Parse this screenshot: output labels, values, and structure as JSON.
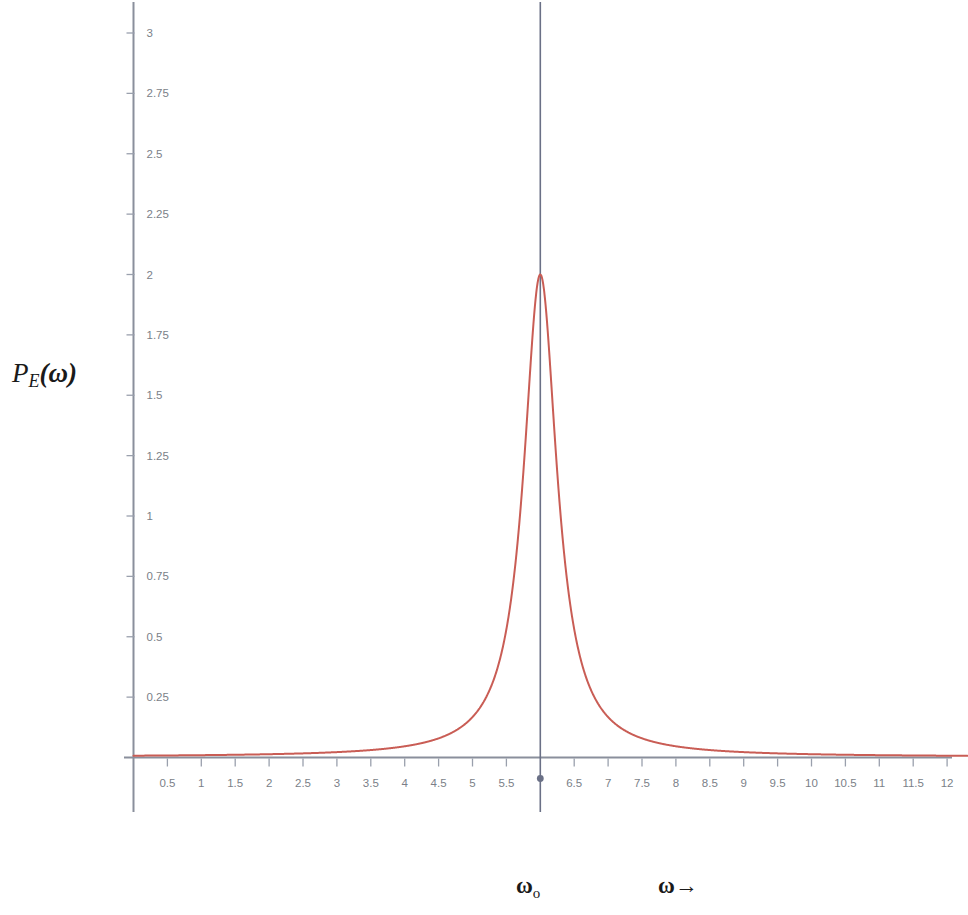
{
  "figure": {
    "type": "line-plot",
    "background_color": "#ffffff",
    "curve_color": "#c95d55",
    "axis_color": "#8a8f9c",
    "marker_line_color": "#6a7086",
    "tick_label_color": "#7b7f88"
  },
  "labels": {
    "y_axis_label_main": "P",
    "y_axis_label_sub": "E",
    "y_axis_label_arg": "(ω)",
    "omega_zero_main": "ω",
    "omega_zero_sub": "o",
    "omega_axis_arrow": "ω→"
  },
  "chart_data": {
    "type": "line",
    "title": "",
    "xlabel": "ω→",
    "ylabel": "P_E(ω)",
    "xlim": [
      0,
      12.3
    ],
    "ylim": [
      0,
      3.15
    ],
    "grid": false,
    "legend": "none",
    "annotations": [
      {
        "text": "ωₒ",
        "x": 6,
        "description": "resonance-frequency-marker-vertical-line"
      }
    ],
    "x_ticks": [
      0.5,
      1,
      1.5,
      2,
      2.5,
      3,
      3.5,
      4,
      4.5,
      5,
      5.5,
      6,
      6.5,
      7,
      7.5,
      8,
      8.5,
      9,
      9.5,
      10,
      10.5,
      11,
      11.5,
      12
    ],
    "x_tick_labels": [
      "0.5",
      "1",
      "1.5",
      "2",
      "2.5",
      "3",
      "3.5",
      "4",
      "4.5",
      "5",
      "5.5",
      "",
      "6.5",
      "7",
      "7.5",
      "8",
      "8.5",
      "9",
      "9.5",
      "10",
      "10.5",
      "11",
      "11.5",
      "12"
    ],
    "y_ticks": [
      0.25,
      0.5,
      0.75,
      1,
      1.25,
      1.5,
      1.75,
      2,
      2.25,
      2.5,
      2.75,
      3
    ],
    "y_tick_labels": [
      "0.25",
      "0.5",
      "0.75",
      "1",
      "1.25",
      "1.5",
      "1.75",
      "2",
      "2.25",
      "2.5",
      "2.75",
      "3"
    ],
    "series": [
      {
        "name": "P_E(ω)",
        "color": "#c95d55",
        "shape": "lorentzian",
        "peak_x": 6.0,
        "peak_y": 2.0,
        "half_width_half_max": 0.3,
        "points": [
          {
            "x": 0.0,
            "y": 0.0025
          },
          {
            "x": 0.5,
            "y": 0.0029
          },
          {
            "x": 1.0,
            "y": 0.0036
          },
          {
            "x": 1.5,
            "y": 0.0044
          },
          {
            "x": 2.0,
            "y": 0.0056
          },
          {
            "x": 2.5,
            "y": 0.0073
          },
          {
            "x": 3.0,
            "y": 0.0099
          },
          {
            "x": 3.5,
            "y": 0.0142
          },
          {
            "x": 4.0,
            "y": 0.0221
          },
          {
            "x": 4.25,
            "y": 0.0289
          },
          {
            "x": 4.5,
            "y": 0.0392
          },
          {
            "x": 4.75,
            "y": 0.0559
          },
          {
            "x": 5.0,
            "y": 0.0847
          },
          {
            "x": 5.25,
            "y": 0.1385
          },
          {
            "x": 5.4,
            "y": 0.1975
          },
          {
            "x": 5.5,
            "y": 0.2571
          },
          {
            "x": 5.6,
            "y": 0.36
          },
          {
            "x": 5.7,
            "y": 0.5294
          },
          {
            "x": 5.75,
            "y": 0.64
          },
          {
            "x": 5.8,
            "y": 0.8
          },
          {
            "x": 5.85,
            "y": 1.0
          },
          {
            "x": 5.9,
            "y": 1.2414
          },
          {
            "x": 5.95,
            "y": 1.5789
          },
          {
            "x": 6.0,
            "y": 2.0
          },
          {
            "x": 6.05,
            "y": 1.5789
          },
          {
            "x": 6.1,
            "y": 1.2414
          },
          {
            "x": 6.15,
            "y": 1.0
          },
          {
            "x": 6.2,
            "y": 0.8
          },
          {
            "x": 6.25,
            "y": 0.64
          },
          {
            "x": 6.3,
            "y": 0.5294
          },
          {
            "x": 6.4,
            "y": 0.36
          },
          {
            "x": 6.5,
            "y": 0.2571
          },
          {
            "x": 6.6,
            "y": 0.1975
          },
          {
            "x": 6.75,
            "y": 0.1385
          },
          {
            "x": 7.0,
            "y": 0.0847
          },
          {
            "x": 7.25,
            "y": 0.0559
          },
          {
            "x": 7.5,
            "y": 0.0392
          },
          {
            "x": 7.75,
            "y": 0.0289
          },
          {
            "x": 8.0,
            "y": 0.0221
          },
          {
            "x": 8.5,
            "y": 0.0142
          },
          {
            "x": 9.0,
            "y": 0.0099
          },
          {
            "x": 9.5,
            "y": 0.0073
          },
          {
            "x": 10.0,
            "y": 0.0056
          },
          {
            "x": 10.5,
            "y": 0.0044
          },
          {
            "x": 11.0,
            "y": 0.0036
          },
          {
            "x": 11.5,
            "y": 0.0029
          },
          {
            "x": 12.0,
            "y": 0.0025
          },
          {
            "x": 12.3,
            "y": 0.0023
          }
        ]
      }
    ]
  }
}
